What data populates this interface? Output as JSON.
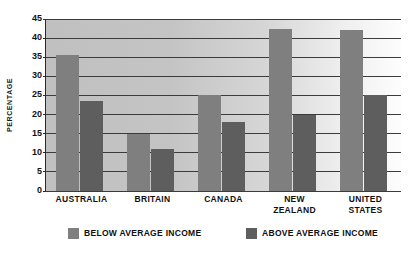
{
  "chart_data": {
    "type": "bar",
    "title": "",
    "xlabel": "",
    "ylabel": "PERCENTAGE",
    "categories": [
      "AUSTRALIA",
      "BRITAIN",
      "CANADA",
      "NEW ZEALAND",
      "UNITED STATES"
    ],
    "category_lines": [
      [
        "AUSTRALIA"
      ],
      [
        "BRITAIN"
      ],
      [
        "CANADA"
      ],
      [
        "NEW",
        "ZEALAND"
      ],
      [
        "UNITED",
        "STATES"
      ]
    ],
    "series": [
      {
        "name": "BELOW AVERAGE INCOME",
        "color": "#7f7f7f",
        "values": [
          35.5,
          15,
          25,
          42.5,
          42
        ]
      },
      {
        "name": "ABOVE AVERAGE INCOME",
        "color": "#5e5e5e",
        "values": [
          23.5,
          11,
          18,
          20,
          25
        ]
      }
    ],
    "ylim": [
      0,
      45
    ],
    "ytick_values": [
      0,
      5,
      10,
      15,
      20,
      25,
      30,
      35,
      40,
      45
    ],
    "ytick_labels": [
      "0",
      "5",
      "10",
      "15",
      "20",
      "25",
      "30",
      "35",
      "40",
      "45"
    ],
    "grid": true,
    "grid_axis": "y",
    "legend_position": "bottom",
    "plot_background": "gradient-gray-to-white"
  },
  "legend": {
    "items": [
      {
        "label": "BELOW AVERAGE INCOME",
        "color": "#7f7f7f"
      },
      {
        "label": "ABOVE AVERAGE INCOME",
        "color": "#5e5e5e"
      }
    ]
  },
  "axis": {
    "y_title": "PERCENTAGE"
  }
}
